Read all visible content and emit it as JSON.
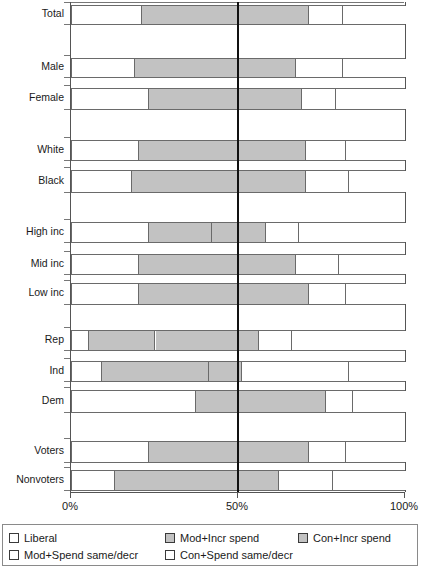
{
  "chart_data": {
    "type": "bar",
    "orientation": "horizontal",
    "stacked": true,
    "title": "",
    "xlabel": "",
    "ylabel": "",
    "xlim": [
      0,
      100
    ],
    "xticks": [
      0,
      50,
      100
    ],
    "xticklabels": [
      "0%",
      "50%",
      "100%"
    ],
    "grid": false,
    "reference_line": 50,
    "legend_position": "bottom",
    "categories": [
      "Total",
      "Male",
      "Female",
      "White",
      "Black",
      "High inc",
      "Mid inc",
      "Low inc",
      "Rep",
      "Ind",
      "Dem",
      "Voters",
      "Nonvoters"
    ],
    "series": [
      {
        "name": "Liberal",
        "fill": "white",
        "values": [
          21,
          19,
          23,
          20,
          18,
          23,
          20,
          20,
          5,
          9,
          37,
          23,
          13
        ]
      },
      {
        "name": "Mod+Incr spend",
        "fill": "gray",
        "values": [
          29,
          31,
          27,
          30,
          32,
          19,
          30,
          30,
          20,
          32,
          13,
          27,
          37
        ]
      },
      {
        "name": "Con+Incr spend",
        "fill": "gray",
        "values": [
          21,
          17,
          19,
          20,
          20,
          16,
          17,
          21,
          21,
          10,
          26,
          21,
          12
        ]
      },
      {
        "name": "Mod+Spend same/decr",
        "fill": "white",
        "values": [
          10,
          14,
          10,
          12,
          13,
          10,
          13,
          11,
          10,
          32,
          8,
          11,
          16
        ]
      },
      {
        "name": "Con+Spend same/decr",
        "fill": "white",
        "values": [
          19,
          19,
          21,
          18,
          17,
          32,
          20,
          18,
          44,
          17,
          16,
          18,
          22
        ]
      }
    ],
    "bars": [
      {
        "category": "Total",
        "boundaries": [
          21,
          50,
          71,
          81,
          100
        ]
      },
      {
        "category": "Male",
        "boundaries": [
          19,
          50,
          67,
          81,
          100
        ]
      },
      {
        "category": "Female",
        "boundaries": [
          23,
          50,
          69,
          79,
          100
        ]
      },
      {
        "category": "White",
        "boundaries": [
          20,
          50,
          70,
          82,
          100
        ]
      },
      {
        "category": "Black",
        "boundaries": [
          18,
          50,
          70,
          83,
          100
        ]
      },
      {
        "category": "High inc",
        "boundaries": [
          23,
          42,
          58,
          68,
          100
        ]
      },
      {
        "category": "Mid inc",
        "boundaries": [
          20,
          50,
          67,
          80,
          100
        ]
      },
      {
        "category": "Low inc",
        "boundaries": [
          20,
          50,
          71,
          82,
          100
        ]
      },
      {
        "category": "Rep",
        "boundaries": [
          5,
          25,
          56,
          66,
          100
        ]
      },
      {
        "category": "Ind",
        "boundaries": [
          9,
          41,
          51,
          83,
          100
        ]
      },
      {
        "category": "Dem",
        "boundaries": [
          37,
          50,
          76,
          84,
          100
        ]
      },
      {
        "category": "Voters",
        "boundaries": [
          23,
          50,
          71,
          82,
          100
        ]
      },
      {
        "category": "Nonvoters",
        "boundaries": [
          13,
          50,
          62,
          78,
          100
        ]
      }
    ],
    "legend": [
      {
        "label": "Liberal",
        "fill": "white"
      },
      {
        "label": "Mod+Incr spend",
        "fill": "gray"
      },
      {
        "label": "Con+Incr spend",
        "fill": "gray"
      },
      {
        "label": "Mod+Spend same/decr",
        "fill": "white"
      },
      {
        "label": "Con+Spend same/decr",
        "fill": "white"
      }
    ]
  },
  "axis": {
    "tick_labels": [
      "0%",
      "50%",
      "100%"
    ]
  }
}
